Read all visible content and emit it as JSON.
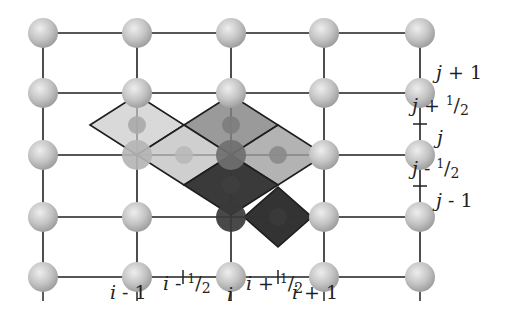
{
  "diagram": {
    "type": "staggered-grid-stencil",
    "grid": {
      "columns_x": [
        43,
        137,
        231,
        324,
        420
      ],
      "rows_y": [
        33,
        93,
        155,
        217,
        277
      ],
      "node_radius": 15,
      "line_color": "#333333",
      "node_color": "#c4c4c4"
    },
    "x_labels": [
      {
        "text": "i - 1",
        "var": "i",
        "rest": " - 1",
        "x": 110,
        "y": 300
      },
      {
        "text": "i - 1/2",
        "var": "i",
        "rest": " - ",
        "num": "1",
        "den": "2",
        "x": 163,
        "y": 290
      },
      {
        "text": "i",
        "var": "i",
        "rest": "",
        "x": 227,
        "y": 302
      },
      {
        "text": "i + 1/2",
        "var": "i",
        "rest": " + ",
        "num": "1",
        "den": "2",
        "x": 246,
        "y": 290
      },
      {
        "text": "i + 1",
        "var": "i",
        "rest": " + 1",
        "x": 292,
        "y": 300
      }
    ],
    "y_labels": [
      {
        "text": "j + 1",
        "var": "j",
        "rest": " + 1",
        "x": 436,
        "y": 80
      },
      {
        "text": "j + 1/2",
        "var": "j",
        "rest": " + ",
        "num": "1",
        "den": "2",
        "x": 412,
        "y": 112
      },
      {
        "text": "j",
        "var": "j",
        "rest": "",
        "x": 437,
        "y": 145
      },
      {
        "text": "j - 1/2",
        "var": "j",
        "rest": " - ",
        "num": "1",
        "den": "2",
        "x": 412,
        "y": 175
      },
      {
        "text": "j - 1",
        "var": "j",
        "rest": " - 1",
        "x": 436,
        "y": 208
      }
    ],
    "ticks": {
      "x": [
        183,
        278
      ],
      "y": [
        124,
        186
      ],
      "tick_on_row_y": 277,
      "tick_on_col_x": 420
    },
    "cells": [
      {
        "name": "light-cell",
        "cx": 137,
        "cy": 125,
        "hw": 47,
        "hh": 30,
        "fill": "#d9d9d9"
      },
      {
        "name": "medium-cell-center",
        "cx": 231,
        "cy": 125,
        "hw": 47,
        "hh": 30,
        "fill": "#9a9a9a"
      },
      {
        "name": "light-cell-bridge",
        "cx": 184,
        "cy": 155,
        "hw": 47,
        "hh": 30,
        "fill": "#cfcfcf"
      },
      {
        "name": "medium-light-cell",
        "cx": 278,
        "cy": 155,
        "hw": 47,
        "hh": 30,
        "fill": "#b3b3b3"
      },
      {
        "name": "dark-cell-upper",
        "cx": 231,
        "cy": 185,
        "hw": 47,
        "hh": 30,
        "fill": "#3a3a3a"
      },
      {
        "name": "dark-cell-lower",
        "cx": 278,
        "cy": 217,
        "hw": 34,
        "hh": 30,
        "fill": "#333333"
      }
    ],
    "small_nodes": [
      {
        "x": 137,
        "y": 125,
        "fill": "#a8a8a8"
      },
      {
        "x": 231,
        "y": 125,
        "fill": "#7d7d7d"
      },
      {
        "x": 184,
        "y": 155,
        "fill": "#b8b8b8"
      },
      {
        "x": 278,
        "y": 155,
        "fill": "#8a8a8a"
      },
      {
        "x": 231,
        "y": 185,
        "fill": "#3f3f3f"
      },
      {
        "x": 278,
        "y": 217,
        "fill": "#3a3a3a"
      }
    ],
    "highlighted_nodes": [
      {
        "x": 137,
        "y": 155,
        "fill": "#b5b5b5"
      },
      {
        "x": 231,
        "y": 155,
        "fill": "#707070"
      },
      {
        "x": 231,
        "y": 217,
        "fill": "#3a3a3a"
      }
    ]
  }
}
